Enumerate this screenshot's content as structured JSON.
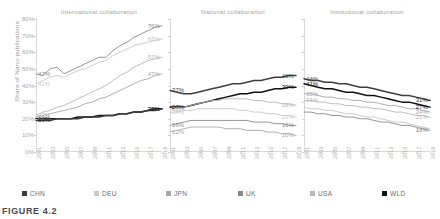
{
  "figure": {
    "caption": "FIGURE 4.2",
    "ylabel": "Share of Nano-publications"
  },
  "legend": {
    "position": "bottom",
    "items": [
      {
        "label": "CHN",
        "color": "#3d3d3d"
      },
      {
        "label": "DEU",
        "color": "#c9c9c9"
      },
      {
        "label": "JPN",
        "color": "#a8a8a8"
      },
      {
        "label": "UK",
        "color": "#8a8a8a"
      },
      {
        "label": "USA",
        "color": "#b8b8b8"
      },
      {
        "label": "WLD",
        "color": "#111111"
      }
    ]
  },
  "axes": {
    "ylim": [
      0,
      80
    ],
    "yticks": [
      "0%",
      "10%",
      "20%",
      "30%",
      "40%",
      "50%",
      "60%",
      "70%",
      "80%"
    ],
    "xticks": [
      "2001",
      "2003",
      "2005",
      "2007",
      "2009",
      "2011",
      "2013",
      "2015",
      "2017",
      "2019"
    ],
    "grid": false
  },
  "chart_data": [
    {
      "type": "line",
      "title": "International collaboration",
      "xlabel": "",
      "ylabel": "Share of Nano-publications",
      "ylim": [
        0,
        80
      ],
      "x": [
        2001,
        2002,
        2003,
        2004,
        2005,
        2006,
        2007,
        2008,
        2009,
        2010,
        2011,
        2012,
        2013,
        2014,
        2015,
        2016,
        2017,
        2018,
        2019
      ],
      "series": [
        {
          "name": "UK",
          "color": "#8a8a8a",
          "start_label": "47%",
          "end_label": "76%",
          "values": [
            47,
            46,
            50,
            51,
            47,
            49,
            51,
            53,
            55,
            57,
            57,
            61,
            64,
            66,
            69,
            71,
            73,
            75,
            76
          ]
        },
        {
          "name": "DEU",
          "color": "#c9c9c9",
          "start_label": "41%",
          "end_label": "68%",
          "values": [
            41,
            43,
            45,
            46,
            45,
            47,
            49,
            50,
            52,
            54,
            55,
            58,
            60,
            62,
            64,
            65,
            66,
            67,
            68
          ]
        },
        {
          "name": "USA",
          "color": "#b8b8b8",
          "start_label": "22%",
          "end_label": "57%",
          "values": [
            22,
            24,
            25,
            27,
            28,
            30,
            32,
            34,
            36,
            38,
            40,
            43,
            46,
            48,
            51,
            53,
            55,
            56,
            57
          ]
        },
        {
          "name": "JPN",
          "color": "#a8a8a8",
          "start_label": "21%",
          "end_label": "47%",
          "values": [
            21,
            22,
            23,
            24,
            25,
            26,
            27,
            29,
            30,
            32,
            33,
            35,
            37,
            39,
            41,
            43,
            44,
            46,
            47
          ]
        },
        {
          "name": "WLD",
          "color": "#111111",
          "start_label": "20%",
          "end_label": "26%",
          "values": [
            20,
            20,
            20,
            20,
            20,
            20,
            21,
            21,
            21,
            22,
            22,
            22,
            23,
            23,
            24,
            24,
            25,
            26,
            26
          ]
        },
        {
          "name": "CHN",
          "color": "#3d3d3d",
          "start_label": "19%",
          "end_label": "26%",
          "values": [
            19,
            19,
            19,
            20,
            20,
            20,
            20,
            21,
            21,
            21,
            22,
            22,
            23,
            23,
            24,
            24,
            25,
            25,
            26
          ]
        }
      ]
    },
    {
      "type": "line",
      "title": "National collaboration",
      "xlabel": "",
      "ylabel": "",
      "ylim": [
        0,
        80
      ],
      "x": [
        2001,
        2002,
        2003,
        2004,
        2005,
        2006,
        2007,
        2008,
        2009,
        2010,
        2011,
        2012,
        2013,
        2014,
        2015,
        2016,
        2017,
        2018,
        2019
      ],
      "series": [
        {
          "name": "CHN",
          "color": "#3d3d3d",
          "start_label": "37%",
          "end_label": "46%",
          "values": [
            37,
            36,
            35,
            35,
            36,
            37,
            38,
            39,
            40,
            41,
            41,
            42,
            43,
            43,
            44,
            45,
            45,
            46,
            46
          ]
        },
        {
          "name": "WLD",
          "color": "#111111",
          "start_label": "27%",
          "end_label": "39%",
          "values": [
            27,
            27,
            27,
            28,
            29,
            30,
            31,
            32,
            33,
            34,
            35,
            35,
            36,
            36,
            37,
            38,
            38,
            39,
            39
          ]
        },
        {
          "name": "USA",
          "color": "#b8b8b8",
          "start_label": "26%",
          "end_label": "28%",
          "values": [
            26,
            26,
            27,
            28,
            29,
            30,
            31,
            31,
            32,
            32,
            32,
            32,
            31,
            31,
            30,
            30,
            29,
            29,
            28
          ]
        },
        {
          "name": "DEU",
          "color": "#c9c9c9",
          "start_label": "24%",
          "end_label": "21%",
          "values": [
            24,
            24,
            25,
            25,
            26,
            26,
            26,
            26,
            26,
            26,
            25,
            25,
            24,
            24,
            23,
            23,
            22,
            22,
            21
          ]
        },
        {
          "name": "UK",
          "color": "#8a8a8a",
          "start_label": "16%",
          "end_label": "16%",
          "values": [
            16,
            17,
            18,
            19,
            19,
            19,
            19,
            19,
            19,
            19,
            19,
            19,
            18,
            18,
            18,
            17,
            17,
            16,
            16
          ]
        },
        {
          "name": "JPN",
          "color": "#a8a8a8",
          "start_label": "12%",
          "end_label": "10%",
          "values": [
            12,
            13,
            14,
            15,
            15,
            15,
            15,
            15,
            14,
            14,
            14,
            13,
            13,
            13,
            12,
            12,
            11,
            11,
            10
          ]
        }
      ]
    },
    {
      "type": "line",
      "title": "Institutional collaboration",
      "xlabel": "",
      "ylabel": "",
      "ylim": [
        0,
        80
      ],
      "x": [
        2001,
        2002,
        2003,
        2004,
        2005,
        2006,
        2007,
        2008,
        2009,
        2010,
        2011,
        2012,
        2013,
        2014,
        2015,
        2016,
        2017,
        2018,
        2019
      ],
      "series": [
        {
          "name": "CHN",
          "color": "#3d3d3d",
          "start_label": "44%",
          "end_label": "31%",
          "values": [
            44,
            43,
            43,
            42,
            42,
            41,
            41,
            40,
            39,
            39,
            38,
            37,
            36,
            35,
            34,
            34,
            33,
            32,
            31
          ]
        },
        {
          "name": "WLD",
          "color": "#111111",
          "start_label": "41%",
          "end_label": "27%",
          "values": [
            41,
            40,
            39,
            38,
            38,
            37,
            36,
            36,
            35,
            34,
            34,
            33,
            32,
            31,
            30,
            30,
            29,
            28,
            27
          ]
        },
        {
          "name": "JPN",
          "color": "#a8a8a8",
          "start_label": "35%",
          "end_label": "24%",
          "values": [
            35,
            35,
            34,
            33,
            33,
            32,
            32,
            31,
            31,
            30,
            30,
            29,
            28,
            28,
            27,
            26,
            26,
            25,
            24
          ]
        },
        {
          "name": "USA",
          "color": "#b8b8b8",
          "start_label": "31%",
          "end_label": "21%",
          "values": [
            31,
            31,
            30,
            30,
            29,
            29,
            28,
            28,
            27,
            27,
            26,
            26,
            25,
            24,
            24,
            23,
            22,
            22,
            21
          ]
        },
        {
          "name": "DEU",
          "color": "#c9c9c9",
          "start_label": "",
          "end_label": "14%",
          "values": [
            27,
            26,
            26,
            25,
            25,
            24,
            23,
            23,
            22,
            21,
            21,
            20,
            19,
            18,
            18,
            17,
            16,
            15,
            14
          ]
        },
        {
          "name": "UK",
          "color": "#8a8a8a",
          "start_label": "",
          "end_label": "13%",
          "values": [
            24,
            24,
            23,
            23,
            22,
            22,
            21,
            21,
            20,
            20,
            19,
            18,
            18,
            17,
            16,
            16,
            15,
            14,
            13
          ]
        }
      ]
    }
  ]
}
